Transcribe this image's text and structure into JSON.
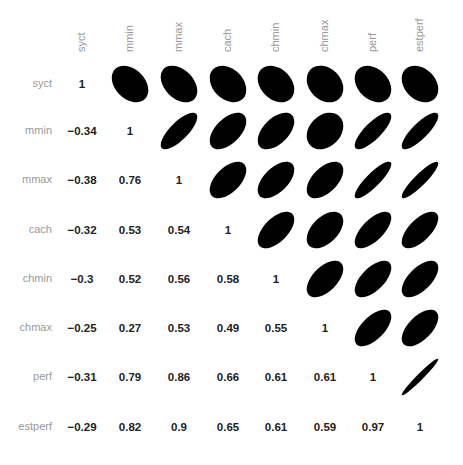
{
  "chart_data": {
    "type": "heatmap",
    "subtype": "correlation-matrix (lower: coefficients, upper: ellipses)",
    "title": "",
    "variables": [
      "syct",
      "mmin",
      "mmax",
      "cach",
      "chmin",
      "chmax",
      "perf",
      "estperf"
    ],
    "matrix": [
      [
        1,
        -0.34,
        -0.38,
        -0.32,
        -0.3,
        -0.25,
        -0.31,
        -0.29
      ],
      [
        -0.34,
        1,
        0.76,
        0.53,
        0.52,
        0.27,
        0.79,
        0.82
      ],
      [
        -0.38,
        0.76,
        1,
        0.54,
        0.56,
        0.53,
        0.86,
        0.9
      ],
      [
        -0.32,
        0.53,
        0.54,
        1,
        0.58,
        0.49,
        0.66,
        0.65
      ],
      [
        -0.3,
        0.52,
        0.56,
        0.58,
        1,
        0.55,
        0.61,
        0.61
      ],
      [
        -0.25,
        0.27,
        0.53,
        0.49,
        0.55,
        1,
        0.61,
        0.59
      ],
      [
        -0.31,
        0.79,
        0.86,
        0.66,
        0.61,
        0.61,
        1,
        0.97
      ],
      [
        -0.29,
        0.82,
        0.9,
        0.65,
        0.61,
        0.59,
        0.97,
        1
      ]
    ],
    "labels": {
      "values": [
        [
          "1"
        ],
        [
          "−0.34",
          "1"
        ],
        [
          "−0.38",
          "0.76",
          "1"
        ],
        [
          "−0.32",
          "0.53",
          "0.54",
          "1"
        ],
        [
          "−0.3",
          "0.52",
          "0.56",
          "0.58",
          "1"
        ],
        [
          "−0.25",
          "0.27",
          "0.53",
          "0.49",
          "0.55",
          "1"
        ],
        [
          "−0.31",
          "0.79",
          "0.86",
          "0.66",
          "0.61",
          "0.61",
          "1"
        ],
        [
          "−0.29",
          "0.82",
          "0.9",
          "0.65",
          "0.61",
          "0.59",
          "0.97",
          "1"
        ]
      ]
    },
    "ellipse_color": "#000000",
    "label_color": "#999999",
    "value_color": "#222222",
    "layout": {
      "grid": false,
      "legend": "none",
      "x_labels": "top, rotated 90°",
      "y_labels": "left"
    }
  }
}
